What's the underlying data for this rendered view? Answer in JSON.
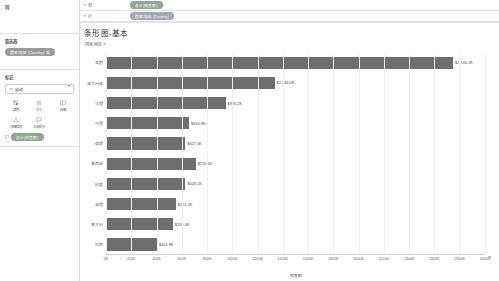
{
  "left_panel": {
    "columns_section": {
      "title": "列"
    },
    "filters_section": {
      "title": "筛选器",
      "pills": [
        {
          "label": "国家/地区 (Country): 美"
        }
      ]
    },
    "marks_section": {
      "title": "标记",
      "mark_type": {
        "value": "自动",
        "icon": "auto-mark-icon",
        "caret": "chevron-down-icon"
      },
      "buttons": [
        {
          "label": "颜色",
          "icon": "color-icon"
        },
        {
          "label": "大小",
          "icon": "size-icon"
        },
        {
          "label": "标签",
          "icon": "label-icon"
        },
        {
          "label": "详细信息",
          "icon": "detail-icon"
        },
        {
          "label": "工具提示",
          "icon": "tooltip-icon"
        }
      ],
      "pills": [
        {
          "label": "总计(销售额)",
          "icon": "measure-icon"
        }
      ]
    }
  },
  "shelves": [
    {
      "name": "列",
      "dot": "▾",
      "pill": "总计(销售额)",
      "pill_style": "green"
    },
    {
      "name": "行",
      "dot": "▾",
      "pill": "国家/地区 (Country)",
      "pill_style": "blue"
    }
  ],
  "sheet": {
    "title": "条形图-基本",
    "column_header": "国家/地区",
    "sort_icon": "sort-descending-icon"
  },
  "chart_data": {
    "type": "bar",
    "orientation": "horizontal",
    "title": "条形图-基本",
    "xlabel": "销售额",
    "ylabel": "国家/地区",
    "xlim": [
      0,
      3000
    ],
    "xunit": "K",
    "grid": true,
    "legend": null,
    "bar_color": "#6e6e6e",
    "categories": [
      "美国",
      "澳大利亚",
      "法国",
      "中国",
      "德国",
      "墨西哥",
      "印度",
      "英国",
      "意大利",
      "巴西"
    ],
    "values": [
      2746.1,
      1334.2,
      946.2,
      656.9,
      627.1,
      710.1,
      628.1,
      552.4,
      528.4,
      402.9
    ],
    "labels": [
      "$2,746.1K",
      "$1,334.2K",
      "$946.2K",
      "$656.9K",
      "$627.1K",
      "$710.1K",
      "$628.1K",
      "$552.4K",
      "$528.4K",
      "$402.9K"
    ],
    "xticks": [
      "0K",
      "200K",
      "400K",
      "600K",
      "800K",
      "1000K",
      "1200K",
      "1400K",
      "1600K",
      "1800K",
      "2000K",
      "2200K",
      "2400K",
      "2600K",
      "2800K",
      "3000K"
    ],
    "xtick_values": [
      0,
      200,
      400,
      600,
      800,
      1000,
      1200,
      1400,
      1600,
      1800,
      2000,
      2200,
      2400,
      2600,
      2800,
      3000
    ]
  }
}
